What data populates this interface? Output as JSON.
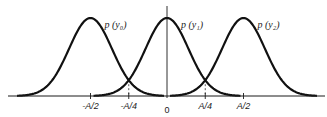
{
  "chart_data": {
    "type": "line",
    "title": "",
    "xlabel": "",
    "ylabel": "",
    "xlim": [
      -1.05,
      1.05
    ],
    "x_unit": "A",
    "series": [
      {
        "name": "p(y0)",
        "label": "p (y₀)",
        "mean": -0.5,
        "sigma": 0.14
      },
      {
        "name": "p(y1)",
        "label": "p (y₁)",
        "mean": 0.0,
        "sigma": 0.14
      },
      {
        "name": "p(y2)",
        "label": "p (y₂)",
        "mean": 0.5,
        "sigma": 0.14
      }
    ],
    "ticks": [
      {
        "value": -0.5,
        "label": "-A/2",
        "dashed_guide": false
      },
      {
        "value": -0.25,
        "label": "-A/4",
        "dashed_guide": true
      },
      {
        "value": 0.0,
        "label": "0",
        "dashed_guide": false
      },
      {
        "value": 0.25,
        "label": "A/4",
        "dashed_guide": true
      },
      {
        "value": 0.5,
        "label": "A/2",
        "dashed_guide": false
      }
    ],
    "vertical_axis_at": 0.0,
    "grid": false,
    "legend": "inline-labels"
  }
}
